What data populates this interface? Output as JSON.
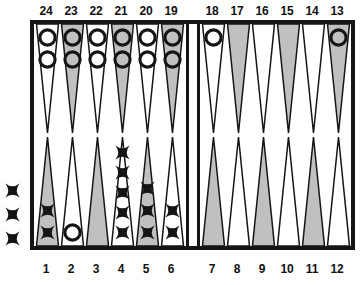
{
  "board": {
    "title": "Backgammon position diagram",
    "frame_color": "#151515",
    "point_light_color": "#ffffff",
    "point_dark_color": "#9a9a9a",
    "checker_x_label": "X",
    "checker_o_label": "O",
    "bar_label": "bar"
  },
  "labels": {
    "top": [
      "24",
      "23",
      "22",
      "21",
      "20",
      "19",
      "18",
      "17",
      "16",
      "15",
      "14",
      "13"
    ],
    "bottom": [
      "1",
      "2",
      "3",
      "4",
      "5",
      "6",
      "7",
      "8",
      "9",
      "10",
      "11",
      "12"
    ]
  },
  "points": [
    {
      "number": "24",
      "quadrant": "top-left",
      "slot": 0,
      "shade": "light",
      "checker": "O",
      "count": 2
    },
    {
      "number": "23",
      "quadrant": "top-left",
      "slot": 1,
      "shade": "dark",
      "checker": "O",
      "count": 2
    },
    {
      "number": "22",
      "quadrant": "top-left",
      "slot": 2,
      "shade": "light",
      "checker": "O",
      "count": 2
    },
    {
      "number": "21",
      "quadrant": "top-left",
      "slot": 3,
      "shade": "dark",
      "checker": "O",
      "count": 2
    },
    {
      "number": "20",
      "quadrant": "top-left",
      "slot": 4,
      "shade": "light",
      "checker": "O",
      "count": 2
    },
    {
      "number": "19",
      "quadrant": "top-left",
      "slot": 5,
      "shade": "dark",
      "checker": "O",
      "count": 2
    },
    {
      "number": "18",
      "quadrant": "top-right",
      "slot": 0,
      "shade": "light",
      "checker": "O",
      "count": 1
    },
    {
      "number": "17",
      "quadrant": "top-right",
      "slot": 1,
      "shade": "dark",
      "checker": "",
      "count": 0
    },
    {
      "number": "16",
      "quadrant": "top-right",
      "slot": 2,
      "shade": "light",
      "checker": "",
      "count": 0
    },
    {
      "number": "15",
      "quadrant": "top-right",
      "slot": 3,
      "shade": "dark",
      "checker": "",
      "count": 0
    },
    {
      "number": "14",
      "quadrant": "top-right",
      "slot": 4,
      "shade": "light",
      "checker": "",
      "count": 0
    },
    {
      "number": "13",
      "quadrant": "top-right",
      "slot": 5,
      "shade": "dark",
      "checker": "O",
      "count": 1
    },
    {
      "number": "1",
      "quadrant": "bottom-left",
      "slot": 0,
      "shade": "dark",
      "checker": "X",
      "count": 2
    },
    {
      "number": "2",
      "quadrant": "bottom-left",
      "slot": 1,
      "shade": "light",
      "checker": "O",
      "count": 1
    },
    {
      "number": "3",
      "quadrant": "bottom-left",
      "slot": 2,
      "shade": "dark",
      "checker": "",
      "count": 0
    },
    {
      "number": "4",
      "quadrant": "bottom-left",
      "slot": 3,
      "shade": "light",
      "checker": "X",
      "count": 5
    },
    {
      "number": "5",
      "quadrant": "bottom-left",
      "slot": 4,
      "shade": "dark",
      "checker": "X",
      "count": 3
    },
    {
      "number": "6",
      "quadrant": "bottom-left",
      "slot": 5,
      "shade": "light",
      "checker": "X",
      "count": 2
    },
    {
      "number": "7",
      "quadrant": "bottom-right",
      "slot": 0,
      "shade": "dark",
      "checker": "",
      "count": 0
    },
    {
      "number": "8",
      "quadrant": "bottom-right",
      "slot": 1,
      "shade": "light",
      "checker": "",
      "count": 0
    },
    {
      "number": "9",
      "quadrant": "bottom-right",
      "slot": 2,
      "shade": "dark",
      "checker": "",
      "count": 0
    },
    {
      "number": "10",
      "quadrant": "bottom-right",
      "slot": 3,
      "shade": "light",
      "checker": "",
      "count": 0
    },
    {
      "number": "11",
      "quadrant": "bottom-right",
      "slot": 4,
      "shade": "dark",
      "checker": "",
      "count": 0
    },
    {
      "number": "12",
      "quadrant": "bottom-right",
      "slot": 5,
      "shade": "light",
      "checker": "",
      "count": 0
    }
  ],
  "offboard": {
    "checker": "X",
    "count": 3,
    "side": "left"
  }
}
